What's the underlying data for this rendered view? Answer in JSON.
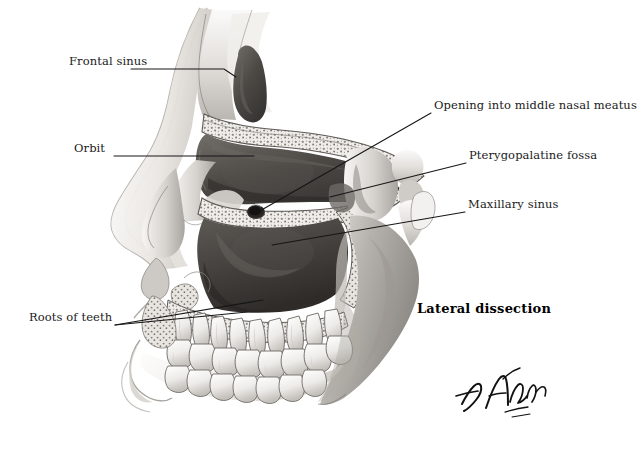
{
  "plate": {
    "background_color": "#ffffff",
    "caption": {
      "text": "Lateral dissection",
      "x": 417,
      "y": 301,
      "bold": true
    },
    "signature": {
      "artist": "F. Netter",
      "name": "netter-signature"
    }
  },
  "illustration": {
    "subject": "Sagittal/lateral dissection of the skull showing the paranasal sinuses",
    "style": "grayscale medical airbrush illustration",
    "ink_color": "#111111",
    "tones": {
      "bone_light": "#f2f0ee",
      "bone_mid": "#cfccc8",
      "bone_shadow": "#9a9792",
      "cavity_dark": "#4a4744",
      "cavity_darker": "#37332f",
      "soft_tissue": "#e4e1dd",
      "outline": "#2a2724"
    },
    "structures": [
      "frontal sinus",
      "orbit",
      "maxillary sinus",
      "opening into middle nasal meatus",
      "pterygopalatine fossa",
      "roots of teeth",
      "nasal cartilages",
      "maxillary teeth",
      "mandibular teeth",
      "mandibular ramus",
      "coronoid process",
      "condylar process",
      "zygomatic arch stump"
    ]
  },
  "labels": [
    {
      "id": "frontal-sinus",
      "text": "Frontal sinus",
      "side": "left",
      "text_x": 69,
      "text_y": 62,
      "leader": [
        [
          131,
          69
        ],
        [
          224,
          69
        ],
        [
          236,
          77
        ]
      ]
    },
    {
      "id": "orbit",
      "text": "Orbit",
      "side": "left",
      "text_x": 74,
      "text_y": 149,
      "leader": [
        [
          114,
          156
        ],
        [
          254,
          156
        ]
      ]
    },
    {
      "id": "roots-of-teeth",
      "text": "Roots of teeth",
      "side": "left",
      "text_x": 29,
      "text_y": 318,
      "leader": [
        [
          115,
          325
        ],
        [
          263,
          300
        ]
      ],
      "leader2": [
        [
          115,
          325
        ],
        [
          247,
          312
        ]
      ]
    },
    {
      "id": "opening-into-middle-nasal-meatus",
      "text": "Opening into middle nasal meatus",
      "side": "right",
      "text_x": 434,
      "text_y": 106,
      "leader": [
        [
          431,
          113
        ],
        [
          258,
          212
        ]
      ]
    },
    {
      "id": "pterygopalatine-fossa",
      "text": "Pterygopalatine fossa",
      "side": "right",
      "text_x": 469,
      "text_y": 156,
      "leader": [
        [
          466,
          163
        ],
        [
          330,
          197
        ]
      ]
    },
    {
      "id": "maxillary-sinus",
      "text": "Maxillary sinus",
      "side": "right",
      "text_x": 468,
      "text_y": 205,
      "leader": [
        [
          465,
          212
        ],
        [
          272,
          245
        ]
      ]
    }
  ]
}
